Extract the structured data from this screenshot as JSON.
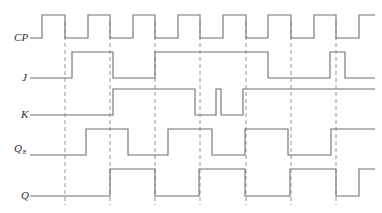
{
  "figure": {
    "type": "timing-diagram",
    "width": 382,
    "height": 213,
    "background_color": "#ffffff",
    "trace_color": "#6e6e6e",
    "dashed_color": "#8a8a8a",
    "label_color": "#2b2b2b"
  },
  "labels": {
    "cp": "CP",
    "j": "J",
    "k": "K",
    "q_e_main": "Q",
    "q_e_sub": "E",
    "q": "Q"
  },
  "axis": {
    "x_start": 30,
    "x_end": 375,
    "clock_first_rise": 42,
    "clock_period": 45.5,
    "clock_high_width": 23
  },
  "chart_data": {
    "type": "line",
    "xlabel": "",
    "ylabel": "",
    "grid": "vertical-dashed-at-clock-falling-edges",
    "legend": "row-labels-at-left",
    "xlim": [
      30,
      375
    ],
    "dashed_gridlines_x": [
      65,
      110,
      155,
      200,
      246,
      291,
      336
    ],
    "signals": [
      {
        "name": "CP",
        "label": "CP",
        "row_y_high": 15,
        "row_y_low": 38,
        "initial_level": 0,
        "transitions": [
          {
            "x": 42,
            "level": 1
          },
          {
            "x": 65,
            "level": 0
          },
          {
            "x": 88,
            "level": 1
          },
          {
            "x": 110,
            "level": 0
          },
          {
            "x": 133,
            "level": 1
          },
          {
            "x": 155,
            "level": 0
          },
          {
            "x": 178,
            "level": 1
          },
          {
            "x": 200,
            "level": 0
          },
          {
            "x": 223,
            "level": 1
          },
          {
            "x": 246,
            "level": 0
          },
          {
            "x": 268,
            "level": 1
          },
          {
            "x": 291,
            "level": 0
          },
          {
            "x": 314,
            "level": 1
          },
          {
            "x": 336,
            "level": 0
          },
          {
            "x": 359,
            "level": 1
          },
          {
            "x": 375,
            "level": 1
          }
        ]
      },
      {
        "name": "J",
        "label": "J",
        "row_y_high": 52,
        "row_y_low": 78,
        "initial_level": 0,
        "transitions": [
          {
            "x": 72,
            "level": 1
          },
          {
            "x": 113,
            "level": 0
          },
          {
            "x": 155,
            "level": 1
          },
          {
            "x": 268,
            "level": 0
          },
          {
            "x": 330,
            "level": 1
          },
          {
            "x": 345,
            "level": 0
          },
          {
            "x": 375,
            "level": 0
          }
        ]
      },
      {
        "name": "K",
        "label": "K",
        "row_y_high": 89,
        "row_y_low": 115,
        "initial_level": 0,
        "transitions": [
          {
            "x": 113,
            "level": 1
          },
          {
            "x": 195,
            "level": 0
          },
          {
            "x": 216,
            "level": 1
          },
          {
            "x": 221,
            "level": 0
          },
          {
            "x": 243,
            "level": 1
          },
          {
            "x": 375,
            "level": 1
          }
        ]
      },
      {
        "name": "QE",
        "label": "Q_E",
        "row_y_high": 129,
        "row_y_low": 155,
        "initial_level": 0,
        "transitions": [
          {
            "x": 86,
            "level": 1
          },
          {
            "x": 128,
            "level": 0
          },
          {
            "x": 168,
            "level": 1
          },
          {
            "x": 212,
            "level": 0
          },
          {
            "x": 245,
            "level": 1
          },
          {
            "x": 288,
            "level": 0
          },
          {
            "x": 331,
            "level": 1
          },
          {
            "x": 375,
            "level": 1
          }
        ]
      },
      {
        "name": "Q",
        "label": "Q",
        "row_y_high": 169,
        "row_y_low": 196,
        "initial_level": 0,
        "transitions": [
          {
            "x": 110,
            "level": 1
          },
          {
            "x": 155,
            "level": 0
          },
          {
            "x": 199,
            "level": 1
          },
          {
            "x": 245,
            "level": 0
          },
          {
            "x": 290,
            "level": 1
          },
          {
            "x": 336,
            "level": 0
          },
          {
            "x": 359,
            "level": 1
          },
          {
            "x": 375,
            "level": 1
          }
        ]
      }
    ],
    "label_positions": [
      {
        "name": "CP",
        "x": 14,
        "y": 37
      },
      {
        "name": "J",
        "x": 22,
        "y": 77
      },
      {
        "name": "K",
        "x": 21,
        "y": 114
      },
      {
        "name": "QE",
        "x": 14,
        "y": 149
      },
      {
        "name": "Q",
        "x": 21,
        "y": 195
      }
    ]
  }
}
